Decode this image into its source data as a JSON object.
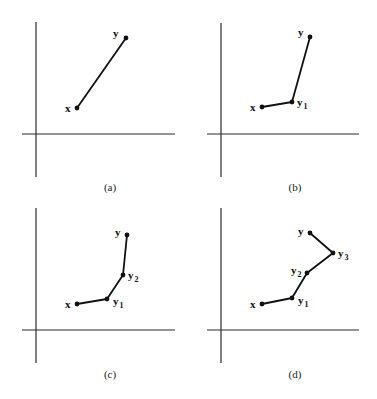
{
  "figure": {
    "panels": [
      {
        "id": "a",
        "caption": "(a)",
        "axes": {
          "vx": 36,
          "vy1": 22,
          "vy2": 177,
          "hy": 134,
          "hx1": 22,
          "hx2": 175
        },
        "caption_pos": [
          110,
          191
        ],
        "points": [
          {
            "name": "x",
            "label": "x",
            "sub": "",
            "pos": [
              77,
              108
            ],
            "label_pos": [
              65,
              112
            ]
          },
          {
            "name": "y",
            "label": "y",
            "sub": "",
            "pos": [
              126,
              38
            ],
            "label_pos": [
              113,
              37
            ]
          }
        ]
      },
      {
        "id": "b",
        "caption": "(b)",
        "axes": {
          "vx": 221,
          "vy1": 23,
          "vy2": 177,
          "hy": 134,
          "hx1": 207,
          "hx2": 359
        },
        "caption_pos": [
          295,
          191
        ],
        "points": [
          {
            "name": "x",
            "label": "x",
            "sub": "",
            "pos": [
              262,
              107
            ],
            "label_pos": [
              250,
              111
            ]
          },
          {
            "name": "y1",
            "label": "y",
            "sub": "1",
            "pos": [
              292,
              102
            ],
            "label_pos": [
              297,
              106
            ]
          },
          {
            "name": "y",
            "label": "y",
            "sub": "",
            "pos": [
              310,
              37
            ],
            "label_pos": [
              298,
              36
            ]
          }
        ]
      },
      {
        "id": "c",
        "caption": "(c)",
        "axes": {
          "vx": 36,
          "vy1": 208,
          "vy2": 363,
          "hy": 330,
          "hx1": 22,
          "hx2": 175
        },
        "caption_pos": [
          110,
          378
        ],
        "points": [
          {
            "name": "x",
            "label": "x",
            "sub": "",
            "pos": [
              77,
              304
            ],
            "label_pos": [
              65,
              308
            ]
          },
          {
            "name": "y1",
            "label": "y",
            "sub": "1",
            "pos": [
              107,
              299
            ],
            "label_pos": [
              113,
              305
            ]
          },
          {
            "name": "y2",
            "label": "y",
            "sub": "2",
            "pos": [
              123,
              275
            ],
            "label_pos": [
              128,
              279
            ]
          },
          {
            "name": "y",
            "label": "y",
            "sub": "",
            "pos": [
              127,
              235
            ],
            "label_pos": [
              115,
              236
            ]
          }
        ]
      },
      {
        "id": "d",
        "caption": "(d)",
        "axes": {
          "vx": 221,
          "vy1": 208,
          "vy2": 363,
          "hy": 330,
          "hx1": 207,
          "hx2": 359
        },
        "caption_pos": [
          295,
          378
        ],
        "points": [
          {
            "name": "x",
            "label": "x",
            "sub": "",
            "pos": [
              262,
              304
            ],
            "label_pos": [
              250,
              308
            ]
          },
          {
            "name": "y1",
            "label": "y",
            "sub": "1",
            "pos": [
              292,
              298
            ],
            "label_pos": [
              298,
              304
            ]
          },
          {
            "name": "y2",
            "label": "y",
            "sub": "2",
            "pos": [
              307,
              273
            ],
            "label_pos": [
              291,
              274
            ]
          },
          {
            "name": "y3",
            "label": "y",
            "sub": "3",
            "pos": [
              333,
              253
            ],
            "label_pos": [
              338,
              257
            ]
          },
          {
            "name": "y",
            "label": "y",
            "sub": "",
            "pos": [
              310,
              233
            ],
            "label_pos": [
              298,
              235
            ]
          }
        ]
      }
    ]
  }
}
